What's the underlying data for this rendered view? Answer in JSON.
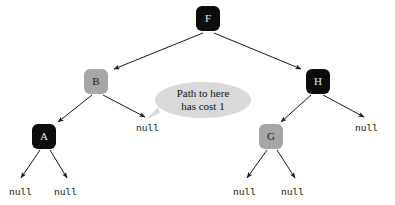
{
  "diagram": {
    "type": "binary-search-tree",
    "background_color": "#ffffff",
    "node_fill_black": "#0c0c0c",
    "node_fill_gray": "#a6a6a6",
    "node_text_light": "#e8e8e8",
    "node_text_dark": "#1a1a1a",
    "edge_color": "#1a1a1a",
    "bubble_fill": "#d9d9d9",
    "nodes": [
      {
        "id": "F",
        "label": "F",
        "color": "black",
        "x": 196,
        "y": 6
      },
      {
        "id": "B",
        "label": "B",
        "color": "gray",
        "x": 84,
        "y": 69
      },
      {
        "id": "H",
        "label": "H",
        "color": "black",
        "x": 306,
        "y": 69
      },
      {
        "id": "A",
        "label": "A",
        "color": "black",
        "x": 32,
        "y": 124
      },
      {
        "id": "G",
        "label": "G",
        "color": "gray",
        "x": 259,
        "y": 124
      }
    ],
    "null_labels": [
      {
        "id": "null-b-right",
        "text": "null",
        "x": 136,
        "y": 122
      },
      {
        "id": "null-h-right",
        "text": "null",
        "x": 355,
        "y": 122
      },
      {
        "id": "null-a-left",
        "text": "null",
        "x": 9,
        "y": 186
      },
      {
        "id": "null-a-right",
        "text": "null",
        "x": 54,
        "y": 186
      },
      {
        "id": "null-g-left",
        "text": "null",
        "x": 233,
        "y": 186
      },
      {
        "id": "null-g-right",
        "text": "null",
        "x": 281,
        "y": 186
      }
    ],
    "edges": [
      {
        "from": "F",
        "to": "B"
      },
      {
        "from": "F",
        "to": "H"
      },
      {
        "from": "B",
        "to": "A"
      },
      {
        "from": "B",
        "to": "null-b-right"
      },
      {
        "from": "H",
        "to": "G"
      },
      {
        "from": "H",
        "to": "null-h-right"
      },
      {
        "from": "A",
        "to": "null-a-left"
      },
      {
        "from": "A",
        "to": "null-a-right"
      },
      {
        "from": "G",
        "to": "null-g-left"
      },
      {
        "from": "G",
        "to": "null-g-right"
      }
    ],
    "callout": {
      "id": "path-cost-callout",
      "line1": "Path to here",
      "line2": "has cost 1",
      "points_to": "B"
    }
  }
}
